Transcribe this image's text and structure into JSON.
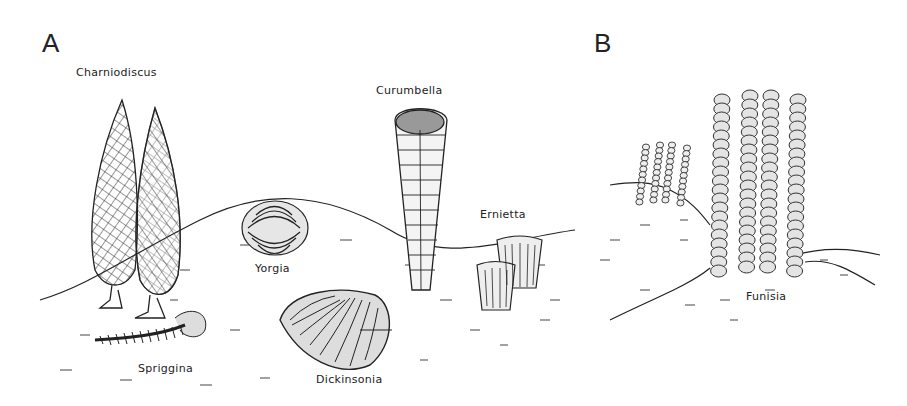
{
  "figure": {
    "panels": [
      {
        "letter": "A",
        "organisms": [
          {
            "name": "Charniodiscus"
          },
          {
            "name": "Curumbella"
          },
          {
            "name": "Yorgia"
          },
          {
            "name": "Ernietta"
          },
          {
            "name": "Spriggina"
          },
          {
            "name": "Dickinsonia"
          }
        ]
      },
      {
        "letter": "B",
        "organisms": [
          {
            "name": "Funisia"
          }
        ]
      }
    ],
    "colors": {
      "ink": "#222222",
      "shade": "#d8d8d8",
      "background": "#ffffff"
    }
  }
}
